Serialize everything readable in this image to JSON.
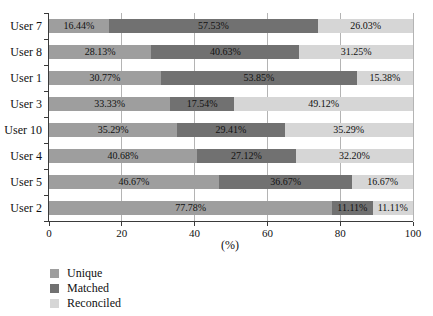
{
  "figure": {
    "background": "#ffffff",
    "text_color": "#111111",
    "axis_color": "#3a3a3a",
    "grid_color": "#b4b4b4"
  },
  "chart_data": {
    "type": "bar",
    "orientation": "horizontal",
    "stacked": true,
    "title": "",
    "xlabel": "(%)",
    "ylabel": "",
    "xlim": [
      0,
      100
    ],
    "x_ticks": [
      0,
      20,
      40,
      60,
      80,
      100
    ],
    "grid": true,
    "legend_position": "bottom-left",
    "categories": [
      "User 7",
      "User 8",
      "User 1",
      "User 3",
      "User 10",
      "User 4",
      "User 5",
      "User 2"
    ],
    "series": [
      {
        "name": "Unique",
        "color": "#9e9e9e",
        "values": [
          16.44,
          28.13,
          30.77,
          33.33,
          35.29,
          40.68,
          46.67,
          77.78
        ],
        "labels": [
          "16.44%",
          "28.13%",
          "30.77%",
          "33.33%",
          "35.29%",
          "40.68%",
          "46.67%",
          "77.78%"
        ]
      },
      {
        "name": "Matched",
        "color": "#717171",
        "values": [
          57.53,
          40.63,
          53.85,
          17.54,
          29.41,
          27.12,
          36.67,
          11.11
        ],
        "labels": [
          "57.53%",
          "40.63%",
          "53.85%",
          "17.54%",
          "29.41%",
          "27.12%",
          "36.67%",
          "11.11%"
        ]
      },
      {
        "name": "Reconciled",
        "color": "#d6d6d6",
        "values": [
          26.03,
          31.25,
          15.38,
          49.12,
          35.29,
          32.2,
          16.67,
          11.11
        ],
        "labels": [
          "26.03%",
          "31.25%",
          "15.38%",
          "49.12%",
          "35.29%",
          "32.20%",
          "16.67%",
          "11.11%"
        ]
      }
    ]
  }
}
